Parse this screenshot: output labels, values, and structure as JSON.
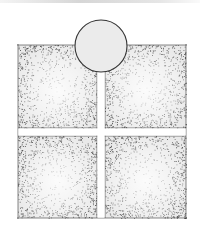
{
  "diagram": {
    "panels": [
      {
        "id": "top-left",
        "x": 18,
        "y": 45,
        "w": 79,
        "h": 83
      },
      {
        "id": "top-right",
        "x": 105,
        "y": 45,
        "w": 81,
        "h": 83
      },
      {
        "id": "bottom-left",
        "x": 18,
        "y": 136,
        "w": 79,
        "h": 82
      },
      {
        "id": "bottom-right",
        "x": 105,
        "y": 136,
        "w": 81,
        "h": 82
      }
    ],
    "circle": {
      "cx": 101,
      "cy": 46,
      "r": 26,
      "fill": "#ebebeb",
      "stroke": "#333333"
    },
    "colors": {
      "stipple": "#555555",
      "outline": "#2a2a2a",
      "background": "#ffffff"
    }
  }
}
